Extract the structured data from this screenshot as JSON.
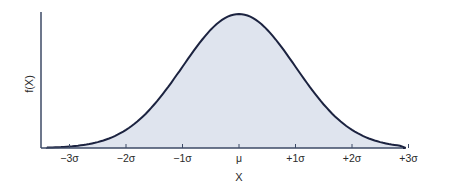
{
  "chart_data": {
    "type": "area",
    "title": "",
    "xlabel": "X",
    "ylabel": "f(X)",
    "distribution": "normal",
    "x_tick_labels": [
      "−3σ",
      "−2σ",
      "−1σ",
      "μ",
      "+1σ",
      "+2σ",
      "+3σ"
    ],
    "x_ticks_sigma": [
      -3,
      -2,
      -1,
      0,
      1,
      2,
      3
    ],
    "xlim_sigma": [
      -3.5,
      3.5
    ],
    "y_ticks": [],
    "grid": false,
    "legend": null,
    "fill_color": "#dfe4ee",
    "line_color": "#1c2340",
    "axis_color": "#3c4a66",
    "points": [
      {
        "x": -3.5,
        "y": 0.002
      },
      {
        "x": -3,
        "y": 0.011
      },
      {
        "x": -2.5,
        "y": 0.044
      },
      {
        "x": -2,
        "y": 0.135
      },
      {
        "x": -1.5,
        "y": 0.325
      },
      {
        "x": -1,
        "y": 0.607
      },
      {
        "x": -0.5,
        "y": 0.882
      },
      {
        "x": 0,
        "y": 1.0
      },
      {
        "x": 0.5,
        "y": 0.882
      },
      {
        "x": 1,
        "y": 0.607
      },
      {
        "x": 1.5,
        "y": 0.325
      },
      {
        "x": 2,
        "y": 0.135
      },
      {
        "x": 2.5,
        "y": 0.044
      },
      {
        "x": 3,
        "y": 0.011
      },
      {
        "x": 3.5,
        "y": 0.002
      }
    ]
  }
}
